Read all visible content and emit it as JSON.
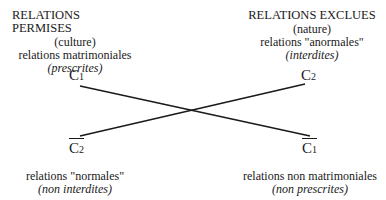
{
  "diagram": {
    "left_top": {
      "title": "RELATIONS PERMISES",
      "line1": "(culture)",
      "line2": "relations matrimoniales",
      "line3": "(prescrites)"
    },
    "right_top": {
      "title": "RELATIONS EXCLUES",
      "line1": "(nature)",
      "line2": "relations \"anormales\"",
      "line3": "(interdites)"
    },
    "left_bottom": {
      "line1": "relations \"normales\"",
      "line2": "(non interdites)"
    },
    "right_bottom": {
      "line1": "relations non matrimoniales",
      "line2": "(non prescrites)"
    },
    "nodes": {
      "c1": {
        "letter": "C",
        "index": "1"
      },
      "c2": {
        "letter": "C",
        "index": "2"
      },
      "c2_bar": {
        "letter": "C",
        "index": "2"
      },
      "c1_bar": {
        "letter": "C",
        "index": "1"
      }
    },
    "edges": [
      {
        "from": "C1",
        "to": "C1-bar"
      },
      {
        "from": "C2-bar",
        "to": "C2"
      }
    ],
    "line_color": "#1a1a1a"
  }
}
